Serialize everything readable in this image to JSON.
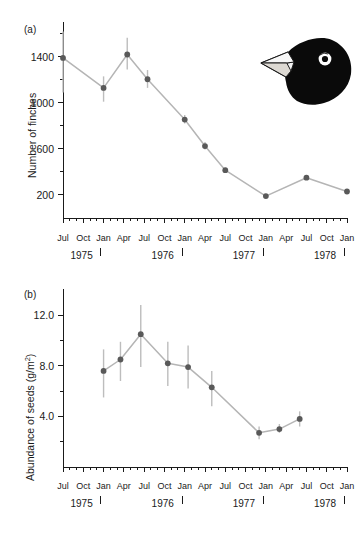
{
  "figure": {
    "background_color": "#ffffff",
    "marker_color": "#595959",
    "line_color": "#b5b5b5",
    "errorbar_color": "#bdbdbd",
    "axis_color": "#1a1a1a"
  },
  "panels": {
    "a": {
      "label": "(a)",
      "inset_icon": "finch-head-icon"
    },
    "b": {
      "label": "(b)"
    }
  },
  "chart_data": [
    {
      "id": "panel-a",
      "type": "line",
      "title": "",
      "panel_label": "(a)",
      "xlabel": "",
      "ylabel": "Number of finches",
      "ylabel_plain": "Number of finches",
      "ylim": [
        0,
        1650
      ],
      "yticks": [
        200,
        600,
        1000,
        1400
      ],
      "ytick_labels": [
        "200",
        "600",
        "1000",
        "1400"
      ],
      "yminor_ticks": [
        400,
        800,
        1200,
        1600
      ],
      "grid": false,
      "legend": null,
      "xlim_months": [
        0,
        42
      ],
      "x_month_ticks": [
        "Jul",
        "Aug",
        "Sep",
        "Oct",
        "Nov",
        "Dec",
        "Jan",
        "Feb",
        "Mar",
        "Apr",
        "May",
        "Jun",
        "Jul",
        "Aug",
        "Sep",
        "Oct",
        "Nov",
        "Dec",
        "Jan",
        "Feb",
        "Mar",
        "Apr",
        "May",
        "Jun",
        "Jul",
        "Aug",
        "Sep",
        "Oct",
        "Nov",
        "Dec",
        "Jan",
        "Feb",
        "Mar",
        "Apr",
        "May",
        "Jun",
        "Jul",
        "Aug",
        "Sep",
        "Oct",
        "Nov",
        "Dec",
        "Jan"
      ],
      "x_labeled_months": [
        {
          "index": 0,
          "label": "Jul"
        },
        {
          "index": 3,
          "label": "Oct"
        },
        {
          "index": 6,
          "label": "Jan"
        },
        {
          "index": 9,
          "label": "Apr"
        },
        {
          "index": 12,
          "label": "Jul"
        },
        {
          "index": 15,
          "label": "Oct"
        },
        {
          "index": 18,
          "label": "Jan"
        },
        {
          "index": 21,
          "label": "Apr"
        },
        {
          "index": 24,
          "label": "Jul"
        },
        {
          "index": 27,
          "label": "Oct"
        },
        {
          "index": 30,
          "label": "Jan"
        },
        {
          "index": 33,
          "label": "Apr"
        },
        {
          "index": 36,
          "label": "Jul"
        },
        {
          "index": 39,
          "label": "Oct"
        },
        {
          "index": 42,
          "label": "Jan"
        }
      ],
      "years": [
        {
          "label": "1975",
          "center_index": 2.75
        },
        {
          "label": "1976",
          "center_index": 14.75
        },
        {
          "label": "1977",
          "center_index": 26.75
        },
        {
          "label": "1978",
          "center_index": 38.75
        }
      ],
      "year_separators": [
        5.6,
        17.6,
        29.6,
        41.6
      ],
      "points": [
        {
          "x_index": 0,
          "x_label": "Jul 1975",
          "y": 1390,
          "err_low": 1090,
          "err_high": 1620
        },
        {
          "x_index": 6,
          "x_label": "Jan 1976",
          "y": 1130,
          "err_low": 1010,
          "err_high": 1230
        },
        {
          "x_index": 9.5,
          "x_label": "Apr 1976",
          "y": 1420,
          "err_low": 1290,
          "err_high": 1565
        },
        {
          "x_index": 12.5,
          "x_label": "Jul 1976",
          "y": 1205,
          "err_low": 1130,
          "err_high": 1285
        },
        {
          "x_index": 18,
          "x_label": "Jan 1977",
          "y": 855,
          "err_low": 820,
          "err_high": 895
        },
        {
          "x_index": 21,
          "x_label": "Apr 1977",
          "y": 625,
          "err_low": 595,
          "err_high": 660
        },
        {
          "x_index": 24,
          "x_label": "Jul 1977",
          "y": 415,
          "err_low": 400,
          "err_high": 435
        },
        {
          "x_index": 30,
          "x_label": "Jan 1978",
          "y": 190,
          "err_low": 185,
          "err_high": 200
        },
        {
          "x_index": 36,
          "x_label": "Jul 1978",
          "y": 350,
          "err_low": 345,
          "err_high": 360
        },
        {
          "x_index": 42,
          "x_label": "Jan 1979",
          "y": 230,
          "err_low": 225,
          "err_high": 240
        }
      ]
    },
    {
      "id": "panel-b",
      "type": "line",
      "title": "",
      "panel_label": "(b)",
      "xlabel": "",
      "ylabel": "Abundance of seeds (g/m2)",
      "ylabel_prefix": "Abundance of seeds (g/m",
      "ylabel_sup": "2",
      "ylabel_suffix": ")",
      "ylim": [
        0,
        13.6
      ],
      "yticks": [
        4.0,
        8.0,
        12.0
      ],
      "ytick_labels": [
        "4.0",
        "8.0",
        "12.0"
      ],
      "yminor_ticks": [
        2.0,
        6.0,
        10.0
      ],
      "grid": false,
      "legend": null,
      "xlim_months": [
        0,
        42
      ],
      "x_labeled_months": [
        {
          "index": 0,
          "label": "Jul"
        },
        {
          "index": 3,
          "label": "Oct"
        },
        {
          "index": 6,
          "label": "Jan"
        },
        {
          "index": 9,
          "label": "Apr"
        },
        {
          "index": 12,
          "label": "Jul"
        },
        {
          "index": 15,
          "label": "Oct"
        },
        {
          "index": 18,
          "label": "Jan"
        },
        {
          "index": 21,
          "label": "Apr"
        },
        {
          "index": 24,
          "label": "Jul"
        },
        {
          "index": 27,
          "label": "Oct"
        },
        {
          "index": 30,
          "label": "Jan"
        },
        {
          "index": 33,
          "label": "Apr"
        },
        {
          "index": 36,
          "label": "Jul"
        },
        {
          "index": 39,
          "label": "Oct"
        },
        {
          "index": 42,
          "label": "Jan"
        }
      ],
      "years": [
        {
          "label": "1975",
          "center_index": 2.75
        },
        {
          "label": "1976",
          "center_index": 14.75
        },
        {
          "label": "1977",
          "center_index": 26.75
        },
        {
          "label": "1978",
          "center_index": 38.75
        }
      ],
      "year_separators": [
        5.6,
        17.6,
        29.6,
        41.6
      ],
      "points": [
        {
          "x_index": 6,
          "x_label": "Jan 1976",
          "y": 7.6,
          "err_low": 5.5,
          "err_high": 9.3
        },
        {
          "x_index": 8.5,
          "x_label": "Mar 1976",
          "y": 8.5,
          "err_low": 6.8,
          "err_high": 9.9
        },
        {
          "x_index": 11.5,
          "x_label": "Jun 1976",
          "y": 10.5,
          "err_low": 7.9,
          "err_high": 12.8
        },
        {
          "x_index": 15.5,
          "x_label": "Oct 1976",
          "y": 8.2,
          "err_low": 6.4,
          "err_high": 9.9
        },
        {
          "x_index": 18.5,
          "x_label": "Jan 1977",
          "y": 7.9,
          "err_low": 6.2,
          "err_high": 9.6
        },
        {
          "x_index": 22,
          "x_label": "May 1977",
          "y": 6.3,
          "err_low": 4.8,
          "err_high": 7.6
        },
        {
          "x_index": 29,
          "x_label": "Dec 1977",
          "y": 2.7,
          "err_low": 2.2,
          "err_high": 3.2
        },
        {
          "x_index": 32,
          "x_label": "Mar 1978",
          "y": 3.0,
          "err_low": 2.7,
          "err_high": 3.4
        },
        {
          "x_index": 35,
          "x_label": "Jun 1978",
          "y": 3.8,
          "err_low": 3.2,
          "err_high": 4.4
        }
      ]
    }
  ]
}
